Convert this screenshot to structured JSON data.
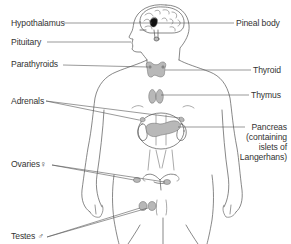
{
  "diagram": {
    "colors": {
      "line": "#555555",
      "gland_fill": "#b8b8b8",
      "pineal_fill": "#111111",
      "background": "#ffffff"
    },
    "labels_left": [
      {
        "id": "hypothalamus",
        "text": "Hypothalamus"
      },
      {
        "id": "pituitary",
        "text": "Pituitary"
      },
      {
        "id": "parathyroids",
        "text": "Parathyroids"
      },
      {
        "id": "adrenals",
        "text": "Adrenals"
      },
      {
        "id": "ovaries",
        "text": "Ovaries♀"
      },
      {
        "id": "testes",
        "text": "Testes ♂"
      }
    ],
    "labels_right": [
      {
        "id": "pineal-body",
        "text": "Pineal body"
      },
      {
        "id": "thyroid",
        "text": "Thyroid"
      },
      {
        "id": "thymus",
        "text": "Thymus"
      },
      {
        "id": "pancreas",
        "lines": [
          "Pancreas",
          "(containing",
          "islets of",
          "Langerhans)"
        ]
      }
    ]
  }
}
